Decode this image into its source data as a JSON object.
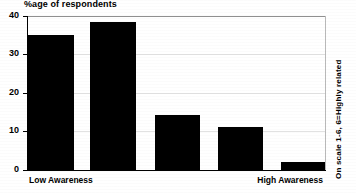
{
  "chart_data": {
    "type": "bar",
    "title": "",
    "ylabel": "%age of respondents",
    "xlabel": "",
    "categories": [
      "Low Awareness",
      "",
      "",
      "",
      "High Awareness"
    ],
    "axis_category_labels": {
      "left": "Low Awareness",
      "right": "High Awareness"
    },
    "values": [
      35,
      38.5,
      14.3,
      11.2,
      2
    ],
    "ylim": [
      0,
      40
    ],
    "yticks": [
      0,
      10,
      20,
      30,
      40
    ],
    "ytick_labels": [
      "0",
      "10",
      "20",
      "30",
      "40"
    ],
    "grid": true,
    "legend": null,
    "annotations": [
      "On scale 1-6, 6=Highly related"
    ],
    "bar_color": "#000000",
    "series": [
      {
        "name": "%age of respondents",
        "values": [
          35,
          38.5,
          14.3,
          11.2,
          2
        ]
      }
    ]
  },
  "labels": {
    "y_axis_title": "%age of respondents",
    "side_note": "On scale 1-6, 6=Highly related",
    "category_low": "Low Awareness",
    "category_high": "High Awareness",
    "tick_0": "0",
    "tick_10": "10",
    "tick_20": "20",
    "tick_30": "30",
    "tick_40": "40"
  },
  "colors": {
    "bar": "#000000",
    "axis": "#000000",
    "grid": "#e2e2e2",
    "background": "#ffffff"
  }
}
